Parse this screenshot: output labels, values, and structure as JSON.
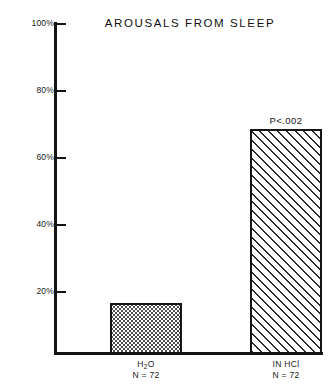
{
  "chart_data": {
    "type": "bar",
    "title": "AROUSALS FROM SLEEP",
    "xlabel": "",
    "ylabel": "",
    "ylim": [
      0,
      100
    ],
    "grid": false,
    "legend": "none",
    "yticks": [
      "20%",
      "40%",
      "60%",
      "80%",
      "100%"
    ],
    "ytick_values": [
      20,
      40,
      60,
      80,
      100
    ],
    "categories": [
      "H2O",
      "IN HCl"
    ],
    "category_labels": [
      "H",
      "O",
      "IN HCl"
    ],
    "values": [
      15.5,
      68
    ],
    "sample_sizes": [
      "N = 72",
      "N = 72"
    ],
    "annotations": [
      "",
      "P<.002"
    ],
    "bar_fills": [
      "dotted",
      "diagonal-hatch"
    ]
  },
  "axis": {
    "y_ticks": [
      {
        "label": "100%",
        "value": 100
      },
      {
        "label": "80%",
        "value": 80
      },
      {
        "label": "60%",
        "value": 60
      },
      {
        "label": "40%",
        "value": 40
      },
      {
        "label": "20%",
        "value": 20
      }
    ]
  },
  "bars": [
    {
      "name": "water",
      "label_prefix": "H",
      "label_sub": "2",
      "label_suffix": "O",
      "n_label": "N = 72",
      "annotation": "",
      "value": 15.5
    },
    {
      "name": "hydrochloric-acid",
      "label_prefix": "IN HCl",
      "label_sub": "",
      "label_suffix": "",
      "n_label": "N = 72",
      "annotation": "P<.002",
      "value": 68
    }
  ],
  "colors": {
    "axis": "#141414",
    "text": "#1a1a1a",
    "background": "#ffffff",
    "pattern": "#2b2b2b"
  }
}
